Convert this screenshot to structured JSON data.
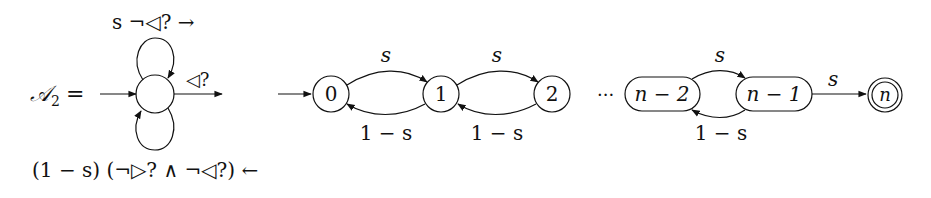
{
  "automaton_a2": {
    "name_label": "𝒜",
    "name_subscript": "2",
    "equals": "=",
    "self_loop_top_label": "s ¬◁? →",
    "exit_label": "◁?",
    "self_loop_bottom_label": "(1 − s) (¬▷? ∧ ¬◁?) ←"
  },
  "chain": {
    "states": [
      {
        "id": "0",
        "label": "0",
        "shape": "circle",
        "initial": true
      },
      {
        "id": "1",
        "label": "1",
        "shape": "circle"
      },
      {
        "id": "2",
        "label": "2",
        "shape": "circle"
      },
      {
        "id": "n-2",
        "label": "n − 2",
        "shape": "pill"
      },
      {
        "id": "n-1",
        "label": "n − 1",
        "shape": "pill"
      },
      {
        "id": "n",
        "label": "n",
        "shape": "double-circle",
        "accepting": true
      }
    ],
    "ellipsis": "···",
    "transitions": [
      {
        "from": "0",
        "to": "1",
        "label": "s"
      },
      {
        "from": "1",
        "to": "0",
        "label": "1 − s"
      },
      {
        "from": "1",
        "to": "2",
        "label": "s"
      },
      {
        "from": "2",
        "to": "1",
        "label": "1 − s"
      },
      {
        "from": "n-2",
        "to": "n-1",
        "label": "s"
      },
      {
        "from": "n-1",
        "to": "n-2",
        "label": "1 − s"
      },
      {
        "from": "n-1",
        "to": "n",
        "label": "s"
      }
    ]
  }
}
